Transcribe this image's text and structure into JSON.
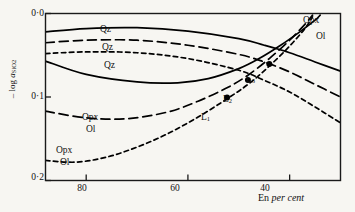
{
  "chart_data": {
    "type": "line",
    "title": "",
    "xlabel": "En per cent",
    "ylabel": "– log a_SiO2",
    "xlim": [
      88,
      30
    ],
    "ylim": [
      0.0,
      0.2
    ],
    "x_ticks": [
      80,
      60,
      40
    ],
    "x_tick_labels": [
      "80",
      "60",
      "40"
    ],
    "y_ticks": [
      0.0,
      0.1,
      0.2
    ],
    "y_tick_labels": [
      "0·0",
      "0·1",
      "0·2"
    ],
    "axis_inverted_x": true,
    "axis_inverted_y": true,
    "grid": false,
    "legend": "inline-curve-labels",
    "series": [
      {
        "name": "Qz (solid)",
        "label": "Qz",
        "style": "solid",
        "points": [
          [
            88,
            0.022
          ],
          [
            80,
            0.018
          ],
          [
            70,
            0.017
          ],
          [
            60,
            0.021
          ],
          [
            50,
            0.03
          ],
          [
            45,
            0.038
          ],
          [
            40,
            0.047
          ],
          [
            35,
            0.058
          ],
          [
            30,
            0.069
          ]
        ]
      },
      {
        "name": "Qz (long-dash)",
        "label": "Qz",
        "style": "long-dash",
        "points": [
          [
            88,
            0.035
          ],
          [
            80,
            0.032
          ],
          [
            70,
            0.032
          ],
          [
            60,
            0.038
          ],
          [
            50,
            0.049
          ],
          [
            45,
            0.058
          ],
          [
            40,
            0.07
          ],
          [
            35,
            0.085
          ],
          [
            30,
            0.1
          ]
        ]
      },
      {
        "name": "Qz (short-dash)",
        "label": "Qz",
        "style": "short-dash",
        "points": [
          [
            88,
            0.048
          ],
          [
            80,
            0.046
          ],
          [
            70,
            0.047
          ],
          [
            60,
            0.054
          ],
          [
            50,
            0.068
          ],
          [
            45,
            0.08
          ],
          [
            40,
            0.094
          ],
          [
            35,
            0.112
          ],
          [
            30,
            0.131
          ]
        ]
      },
      {
        "name": "Opx/Ol (solid)",
        "label": "Opx/Ol",
        "style": "solid",
        "points": [
          [
            88,
            0.057
          ],
          [
            80,
            0.073
          ],
          [
            70,
            0.082
          ],
          [
            62,
            0.083
          ],
          [
            56,
            0.078
          ],
          [
            50,
            0.066
          ],
          [
            46,
            0.054
          ],
          [
            42,
            0.039
          ],
          [
            38,
            0.022
          ],
          [
            35,
            0.008
          ],
          [
            34,
            0.002
          ]
        ]
      },
      {
        "name": "Opx/Ol (long-dash)",
        "label": "Opx/Ol",
        "style": "long-dash",
        "points": [
          [
            88,
            0.117
          ],
          [
            80,
            0.125
          ],
          [
            72,
            0.126
          ],
          [
            64,
            0.118
          ],
          [
            58,
            0.105
          ],
          [
            52,
            0.088
          ],
          [
            48,
            0.073
          ],
          [
            44,
            0.054
          ],
          [
            40,
            0.032
          ],
          [
            37,
            0.013
          ],
          [
            35.5,
            0.002
          ]
        ]
      },
      {
        "name": "Opx/Ol (short-dash)",
        "label": "Opx/Ol",
        "style": "short-dash",
        "points": [
          [
            88,
            0.176
          ],
          [
            82,
            0.178
          ],
          [
            76,
            0.172
          ],
          [
            70,
            0.16
          ],
          [
            64,
            0.144
          ],
          [
            58,
            0.124
          ],
          [
            52,
            0.101
          ],
          [
            48,
            0.084
          ],
          [
            44,
            0.063
          ],
          [
            40,
            0.039
          ],
          [
            37,
            0.018
          ],
          [
            35.5,
            0.004
          ]
        ]
      }
    ],
    "annotations": [
      {
        "name": "L1",
        "label": "L",
        "sub": "1",
        "x": 52.3,
        "y": 0.1005
      },
      {
        "name": "L2",
        "label": "L",
        "sub": "2",
        "x": 48.2,
        "y": 0.0795
      },
      {
        "name": "L3",
        "label": "L",
        "sub": "3",
        "x": 44.0,
        "y": 0.0605
      }
    ],
    "curve_labels": [
      {
        "name": "qz-label-1",
        "text": "Qz"
      },
      {
        "name": "qz-label-2",
        "text": "Qz"
      },
      {
        "name": "qz-label-3",
        "text": "Qz"
      },
      {
        "name": "opx-label-mid",
        "text": "Opx"
      },
      {
        "name": "ol-label-mid",
        "text": "Ol"
      },
      {
        "name": "opx-label-low",
        "text": "Opx"
      },
      {
        "name": "ol-label-low",
        "text": "Ol"
      },
      {
        "name": "opx-label-right",
        "text": "Opx"
      },
      {
        "name": "ol-label-right",
        "text": "Ol"
      }
    ],
    "colors": {
      "curve": "#000000",
      "axis": "#1a1a1a",
      "background": "#f7f6f2",
      "marker": "#000000"
    }
  },
  "axis": {
    "y_label_prefix": "– log ",
    "y_label_italic": "a",
    "y_label_sub": "SiO",
    "y_label_sub2": "2",
    "x_label_roman": "En",
    "x_label_italic": "per cent",
    "y_tick_0": "0·0",
    "y_tick_1": "0·1",
    "y_tick_2": "0·2",
    "x_tick_0": "80",
    "x_tick_1": "60",
    "x_tick_2": "40"
  },
  "labels": {
    "qz1": "Qz",
    "qz2": "Qz",
    "qz3": "Qz",
    "opx_mid": "Opx",
    "ol_mid": "Ol",
    "opx_low": "Opx",
    "ol_low": "Ol",
    "opx_right": "Opx",
    "ol_right": "Ol",
    "L": "L",
    "L1_sub": "1",
    "L2_sub": "2",
    "L3_sub": "3"
  }
}
